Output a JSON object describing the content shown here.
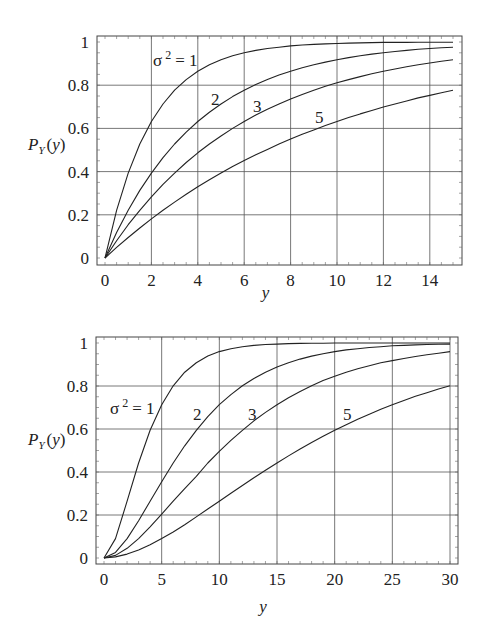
{
  "chart_data": [
    {
      "type": "line",
      "title": "",
      "xlabel": "y",
      "ylabel": "P_Y(y)",
      "xlim": [
        0,
        15
      ],
      "ylim": [
        0,
        1
      ],
      "xticks": [
        0,
        2,
        4,
        6,
        8,
        10,
        12,
        14
      ],
      "yticks": [
        0,
        0.2,
        0.4,
        0.6,
        0.8,
        1
      ],
      "xtick_labels": [
        "0",
        "2",
        "4",
        "6",
        "8",
        "10",
        "12",
        "14"
      ],
      "ytick_labels": [
        "0",
        "0.2",
        "0.4",
        "0.6",
        "0.8",
        "1"
      ],
      "grid": true,
      "legend": "inline labels",
      "x": [
        0,
        0.5,
        1,
        1.5,
        2,
        2.5,
        3,
        3.5,
        4,
        4.5,
        5,
        5.5,
        6,
        6.5,
        7,
        7.5,
        8,
        8.5,
        9,
        9.5,
        10,
        10.5,
        11,
        11.5,
        12,
        12.5,
        13,
        13.5,
        14,
        14.5,
        15
      ],
      "series": [
        {
          "name": "σ² = 1",
          "label": "σ² = 1",
          "label_pos": [
            153,
            66
          ],
          "values": [
            0,
            0.221,
            0.393,
            0.528,
            0.632,
            0.713,
            0.777,
            0.826,
            0.865,
            0.895,
            0.918,
            0.936,
            0.95,
            0.961,
            0.97,
            0.976,
            0.982,
            0.986,
            0.989,
            0.991,
            0.993,
            0.995,
            0.996,
            0.997,
            0.998,
            0.998,
            0.998,
            0.999,
            0.999,
            0.999,
            0.999
          ]
        },
        {
          "name": "σ² = 2",
          "label": "2",
          "label_pos": [
            211,
            105
          ],
          "values": [
            0,
            0.118,
            0.221,
            0.313,
            0.393,
            0.465,
            0.528,
            0.583,
            0.632,
            0.675,
            0.713,
            0.747,
            0.777,
            0.803,
            0.826,
            0.847,
            0.865,
            0.881,
            0.895,
            0.907,
            0.918,
            0.928,
            0.936,
            0.944,
            0.95,
            0.956,
            0.961,
            0.966,
            0.97,
            0.973,
            0.976
          ]
        },
        {
          "name": "σ² = 3",
          "label": "3",
          "label_pos": [
            253,
            112
          ],
          "values": [
            0,
            0.08,
            0.154,
            0.221,
            0.283,
            0.341,
            0.393,
            0.442,
            0.487,
            0.528,
            0.565,
            0.6,
            0.632,
            0.662,
            0.689,
            0.713,
            0.736,
            0.757,
            0.777,
            0.795,
            0.811,
            0.826,
            0.84,
            0.853,
            0.865,
            0.875,
            0.885,
            0.895,
            0.903,
            0.911,
            0.918
          ]
        },
        {
          "name": "σ² = 5",
          "label": "5",
          "label_pos": [
            315,
            123
          ],
          "values": [
            0,
            0.049,
            0.095,
            0.139,
            0.181,
            0.221,
            0.259,
            0.295,
            0.33,
            0.362,
            0.393,
            0.423,
            0.451,
            0.478,
            0.503,
            0.528,
            0.551,
            0.573,
            0.593,
            0.613,
            0.632,
            0.65,
            0.667,
            0.683,
            0.699,
            0.713,
            0.727,
            0.741,
            0.753,
            0.765,
            0.777
          ]
        }
      ]
    },
    {
      "type": "line",
      "title": "",
      "xlabel": "y",
      "ylabel": "P_Y(y)",
      "xlim": [
        0,
        30
      ],
      "ylim": [
        0,
        1
      ],
      "xticks": [
        0,
        5,
        10,
        15,
        20,
        25,
        30
      ],
      "yticks": [
        0,
        0.2,
        0.4,
        0.6,
        0.8,
        1
      ],
      "xtick_labels": [
        "0",
        "5",
        "10",
        "15",
        "20",
        "25",
        "30"
      ],
      "ytick_labels": [
        "0",
        "0.2",
        "0.4",
        "0.6",
        "0.8",
        "1"
      ],
      "grid": true,
      "legend": "inline labels",
      "x": [
        0,
        1,
        2,
        3,
        4,
        5,
        6,
        7,
        8,
        9,
        10,
        11,
        12,
        13,
        14,
        15,
        16,
        17,
        18,
        19,
        20,
        21,
        22,
        23,
        24,
        25,
        26,
        27,
        28,
        29,
        30
      ],
      "series": [
        {
          "name": "σ² = 1",
          "label": "σ² = 1",
          "label_pos": [
            110,
            414
          ],
          "values": [
            0,
            0.09,
            0.264,
            0.442,
            0.594,
            0.713,
            0.801,
            0.864,
            0.908,
            0.939,
            0.96,
            0.973,
            0.983,
            0.989,
            0.993,
            0.995,
            0.997,
            0.998,
            0.999,
            0.999,
            1.0,
            1.0,
            1.0,
            1.0,
            1.0,
            1.0,
            1.0,
            1.0,
            1.0,
            1.0,
            1.0
          ]
        },
        {
          "name": "σ² = 2",
          "label": "2",
          "label_pos": [
            193,
            420
          ],
          "values": [
            0,
            0.026,
            0.09,
            0.173,
            0.264,
            0.355,
            0.442,
            0.522,
            0.594,
            0.657,
            0.713,
            0.76,
            0.801,
            0.835,
            0.864,
            0.888,
            0.908,
            0.925,
            0.939,
            0.95,
            0.96,
            0.968,
            0.973,
            0.979,
            0.983,
            0.987,
            0.989,
            0.991,
            0.993,
            0.994,
            0.995
          ]
        },
        {
          "name": "σ² = 3",
          "label": "3",
          "label_pos": [
            248,
            420
          ],
          "values": [
            0,
            0.012,
            0.045,
            0.09,
            0.145,
            0.204,
            0.264,
            0.323,
            0.38,
            0.442,
            0.496,
            0.547,
            0.594,
            0.638,
            0.677,
            0.713,
            0.745,
            0.774,
            0.801,
            0.825,
            0.845,
            0.864,
            0.88,
            0.894,
            0.908,
            0.918,
            0.928,
            0.937,
            0.945,
            0.952,
            0.96
          ]
        },
        {
          "name": "σ² = 5",
          "label": "5",
          "label_pos": [
            343,
            420
          ],
          "values": [
            0,
            0.005,
            0.018,
            0.037,
            0.062,
            0.09,
            0.121,
            0.155,
            0.191,
            0.228,
            0.264,
            0.301,
            0.337,
            0.373,
            0.408,
            0.442,
            0.475,
            0.507,
            0.537,
            0.566,
            0.594,
            0.62,
            0.645,
            0.669,
            0.692,
            0.713,
            0.733,
            0.752,
            0.769,
            0.786,
            0.801
          ]
        }
      ]
    }
  ]
}
